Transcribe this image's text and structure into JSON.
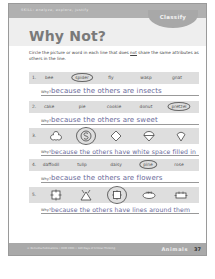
{
  "header": {
    "skill_line": "SKILL: analyze, explore, justify",
    "tab": "Classify",
    "title": "Why Not?"
  },
  "instructions": {
    "before": "Circle the picture or word in each line that does ",
    "emphasis": "not",
    "after": " share the same attributes as others in the line."
  },
  "why_label": "Why?",
  "questions": [
    {
      "number": "1.",
      "type": "words",
      "items": [
        "bee",
        "spider",
        "fly",
        "wasp",
        "gnat"
      ],
      "circled_index": 1,
      "answer": "because the others are insects"
    },
    {
      "number": "2.",
      "type": "words",
      "items": [
        "cake",
        "pie",
        "cookie",
        "donut",
        "pretzel"
      ],
      "circled_index": 4,
      "answer": "because the others are sweet"
    },
    {
      "number": "3.",
      "type": "shapes",
      "items": [
        "clover-outline-icon",
        "circle-s-icon",
        "diamond-outline-icon",
        "circle-divided-icon",
        "pentagon-outline-icon"
      ],
      "circled_index": 1,
      "answer": "because the others have white space filled in"
    },
    {
      "number": "4.",
      "type": "words",
      "items": [
        "daffodil",
        "tulip",
        "daisy",
        "pine",
        "rose"
      ],
      "circled_index": 3,
      "answer": "because the others are flowers"
    },
    {
      "number": "5.",
      "type": "shapes",
      "items": [
        "square-ticks-icon",
        "triangle-ticks-icon",
        "square-in-circle-icon",
        "oval-ticks-icon",
        "rectangle-ticks-icon"
      ],
      "circled_index": 2,
      "answer": "because the others have lines around them"
    }
  ],
  "footer": {
    "copyright": "© Remedia Publications • REM 2003 • 180 Days of Critical Thinking",
    "category": "Animals",
    "page_number": "37"
  },
  "colors": {
    "bar": "#b0b0b0",
    "row_bg": "#dedede",
    "answer_text": "#6a6a9a"
  }
}
